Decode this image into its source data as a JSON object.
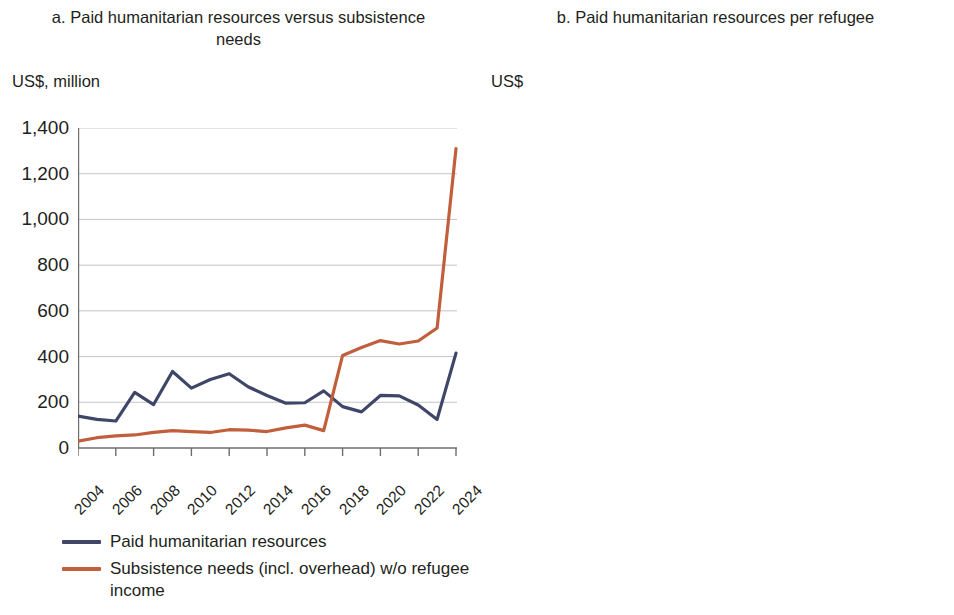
{
  "panels": [
    {
      "title": "a. Paid humanitarian resources versus subsistence needs",
      "unit": "US$, million",
      "legend": [
        {
          "label": "Paid humanitarian resources",
          "color": "#3f4668"
        },
        {
          "label": "Subsistence needs (incl. overhead) w/o refugee income",
          "color": "#c15f3c"
        }
      ]
    },
    {
      "title": "b. Paid humanitarian resources per refugee",
      "unit": "US$",
      "legend": [
        {
          "label": "Paid humanitarian resources",
          "color": "#3f4668"
        }
      ]
    }
  ],
  "chart_data": [
    {
      "type": "line",
      "title": "a. Paid humanitarian resources versus subsistence needs",
      "xlabel": "",
      "ylabel": "US$, million",
      "ylim": [
        0,
        1400
      ],
      "yticks": [
        0,
        200,
        400,
        600,
        800,
        1000,
        1200,
        1400
      ],
      "ytick_labels": [
        "0",
        "200",
        "400",
        "600",
        "800",
        "1,000",
        "1,200",
        "1,400"
      ],
      "xlim": [
        2004,
        2024
      ],
      "x": [
        2004,
        2005,
        2006,
        2007,
        2008,
        2009,
        2010,
        2011,
        2012,
        2013,
        2014,
        2015,
        2016,
        2017,
        2018,
        2019,
        2020,
        2021,
        2022,
        2023,
        2024
      ],
      "xtick_labels": [
        "2004",
        "2006",
        "2008",
        "2010",
        "2012",
        "2014",
        "2016",
        "2018",
        "2020",
        "2022",
        "2024"
      ],
      "grid": "horizontal",
      "legend_position": "below",
      "series": [
        {
          "name": "Paid humanitarian resources",
          "color": "#3f4668",
          "values": [
            140,
            125,
            118,
            243,
            190,
            335,
            262,
            300,
            325,
            268,
            230,
            196,
            198,
            250,
            181,
            158,
            230,
            228,
            188,
            125,
            415
          ]
        },
        {
          "name": "Subsistence needs (incl. overhead) w/o refugee income",
          "color": "#c15f3c",
          "values": [
            30,
            45,
            53,
            57,
            68,
            76,
            72,
            68,
            80,
            78,
            72,
            88,
            100,
            76,
            405,
            440,
            470,
            455,
            468,
            525,
            1310
          ]
        }
      ]
    },
    {
      "type": "line",
      "title": "b. Paid humanitarian resources per refugee",
      "xlabel": "",
      "ylabel": "US$",
      "ylim": [
        0,
        6000
      ],
      "yticks": [
        0,
        1000,
        2000,
        3000,
        4000,
        5000,
        6000
      ],
      "ytick_labels": [
        "0",
        "1,000",
        "2,000",
        "3,000",
        "4,000",
        "5,000",
        "6,000"
      ],
      "xlim": [
        2004,
        2024
      ],
      "x": [
        2004,
        2005,
        2006,
        2007,
        2008,
        2009,
        2010,
        2011,
        2012,
        2013,
        2014,
        2015,
        2016,
        2017,
        2018,
        2019,
        2020,
        2021,
        2022,
        2023,
        2024
      ],
      "xtick_labels": [
        "2004",
        "2006",
        "2008",
        "2010",
        "2012",
        "2014",
        "2016",
        "2018",
        "2020",
        "2022",
        "2024"
      ],
      "grid": "horizontal",
      "legend_position": "below",
      "series": [
        {
          "name": "Paid humanitarian resources",
          "color": "#3f4668",
          "values": [
            4900,
            3200,
            2990,
            5230,
            3700,
            4750,
            4300,
            4060,
            4950,
            3500,
            2060,
            2620,
            660,
            470,
            380,
            450,
            510,
            460,
            300,
            215,
            330
          ]
        }
      ]
    }
  ]
}
